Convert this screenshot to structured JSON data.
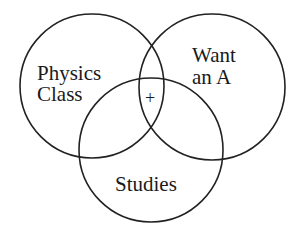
{
  "diagram": {
    "type": "venn",
    "sets": [
      {
        "id": "physics",
        "label_lines": [
          "Physics",
          "Class"
        ]
      },
      {
        "id": "want_a",
        "label_lines": [
          "Want",
          "an A"
        ]
      },
      {
        "id": "studies",
        "label_lines": [
          "Studies"
        ]
      }
    ],
    "intersection_marker": {
      "sets": [
        "physics",
        "want_a",
        "studies"
      ],
      "symbol": "+"
    },
    "colors": {
      "stroke": "#222222",
      "text": "#1a1a1a",
      "background": "#ffffff"
    }
  }
}
